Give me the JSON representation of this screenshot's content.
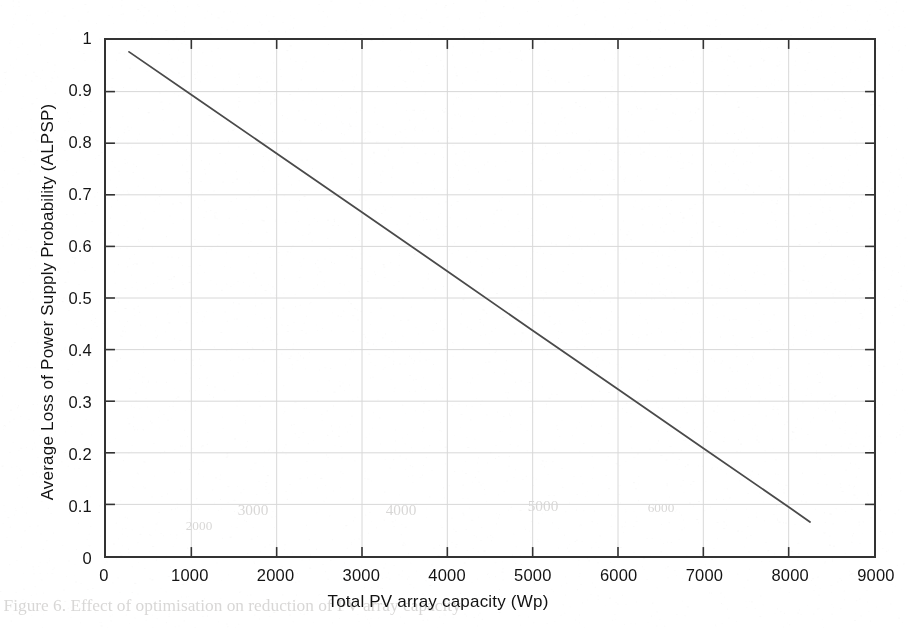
{
  "figure": {
    "kind": "line-plot",
    "background_color": "#ffffff",
    "frame_color": "#333333",
    "grid_color": "#d8d8d8",
    "series_color": "#4a4a4a"
  },
  "chart_data": {
    "type": "line",
    "title": "",
    "subtitle": "",
    "xlabel": "Total PV array capacity (Wp)",
    "ylabel": "Average Loss of Power Supply Probability (ALPSP)",
    "xlim": [
      0,
      9000
    ],
    "ylim": [
      0,
      1
    ],
    "xticks": [
      0,
      1000,
      2000,
      3000,
      4000,
      5000,
      6000,
      7000,
      8000,
      9000
    ],
    "xtick_labels": [
      "0",
      "1000",
      "2000",
      "3000",
      "4000",
      "5000",
      "6000",
      "7000",
      "8000",
      "9000"
    ],
    "yticks": [
      0,
      0.1,
      0.2,
      0.3,
      0.4,
      0.5,
      0.6,
      0.7,
      0.8,
      0.9,
      1
    ],
    "ytick_labels": [
      "0",
      "0.1",
      "0.2",
      "0.3",
      "0.4",
      "0.5",
      "0.6",
      "0.7",
      "0.8",
      "0.9",
      "1"
    ],
    "grid": true,
    "legend": false,
    "legend_position": "none",
    "annotations": [],
    "series": [
      {
        "name": "ALPSP vs PV array capacity",
        "color": "#4a4a4a",
        "line_width": 1.8,
        "marker": "none",
        "x": [
          270,
          1000,
          2000,
          3000,
          4000,
          5000,
          6000,
          7000,
          8000,
          8250
        ],
        "y": [
          0.977,
          0.894,
          0.78,
          0.666,
          0.552,
          0.437,
          0.323,
          0.209,
          0.095,
          0.066
        ]
      }
    ]
  },
  "ghost_bleed_text": [
    {
      "text": "Figure 6. Effect of optimisation on reduction of PV array capacity",
      "x": 8,
      "y": 596,
      "size": 17
    },
    {
      "text": "3000",
      "x": 238,
      "y": 502,
      "size": 15
    },
    {
      "text": "4000",
      "x": 386,
      "y": 502,
      "size": 15
    },
    {
      "text": "5000",
      "x": 528,
      "y": 498,
      "size": 15
    },
    {
      "text": "2000",
      "x": 186,
      "y": 518,
      "size": 13
    },
    {
      "text": "6000",
      "x": 648,
      "y": 500,
      "size": 13
    }
  ]
}
